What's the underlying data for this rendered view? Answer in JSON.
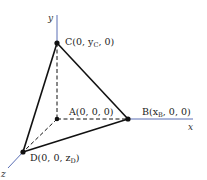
{
  "diagram": {
    "type": "3d-tetrahedron-coordinate-diagram",
    "axes": {
      "x": {
        "label": "x",
        "color": "#5a6fb5"
      },
      "y": {
        "label": "y",
        "color": "#5a6fb5"
      },
      "z": {
        "label": "z",
        "color": "#5a6fb5"
      }
    },
    "points": {
      "A": {
        "label": "A(0, 0, 0)"
      },
      "B": {
        "label": "B(x",
        "sub": "B",
        "rest": ", 0, 0)"
      },
      "C": {
        "label": "C(0, y",
        "sub": "C",
        "rest": ", 0)"
      },
      "D": {
        "label": "D(0, 0, z",
        "sub": "D",
        "rest": ")"
      }
    },
    "edges": {
      "solid": [
        "C-B",
        "C-D",
        "D-B"
      ],
      "dashed": [
        "C-A",
        "A-B",
        "A-D"
      ]
    },
    "colors": {
      "edge": "#111111",
      "axis": "#5a6fb5",
      "point": "#111111"
    }
  }
}
